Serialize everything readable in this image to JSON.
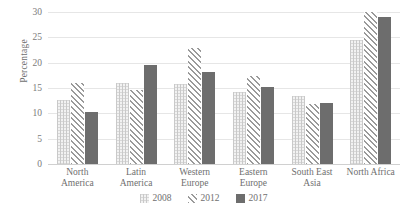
{
  "chart_data": {
    "type": "bar",
    "title": "",
    "xlabel": "",
    "ylabel": "Percentage",
    "ylim": [
      0,
      30
    ],
    "yticks": [
      0,
      5,
      10,
      15,
      20,
      25,
      30
    ],
    "grid": true,
    "legend_position": "bottom",
    "categories": [
      "North\nAmerica",
      "Latin\nAmerica",
      "Western\nEurope",
      "Eastern\nEurope",
      "South East\nAsia",
      "North Africa"
    ],
    "series": [
      {
        "name": "2008",
        "pattern": "fine-grid",
        "color": "#f2f2f2",
        "values": [
          12.7,
          16.0,
          15.8,
          14.3,
          13.4,
          24.5
        ]
      },
      {
        "name": "2012",
        "pattern": "diagonal-hatch",
        "color": "#9a9a9a",
        "values": [
          16.0,
          14.6,
          22.9,
          17.3,
          11.9,
          30.0
        ]
      },
      {
        "name": "2017",
        "pattern": "solid",
        "color": "#6d6d6d",
        "values": [
          10.3,
          19.6,
          18.2,
          15.2,
          12.1,
          29.0
        ]
      }
    ]
  }
}
